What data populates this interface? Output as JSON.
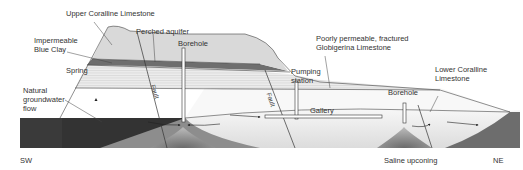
{
  "diagram": {
    "labels": {
      "upper_coralline": "Upper Coralline Limestone",
      "perched_aquifer": "Perched aquifer",
      "borehole_1": "Borehole",
      "blue_clay_line1": "Impermeable",
      "blue_clay_line2": "Blue Clay",
      "spring": "Spring",
      "globigerina_line1": "Poorly permeable, fractured",
      "globigerina_line2": "Globigerina Limestone",
      "pumping_line1": "Pumping",
      "pumping_line2": "station",
      "lower_coralline_line1": "Lower Coralline",
      "lower_coralline_line2": "Limestone",
      "natural_flow_line1": "Natural",
      "natural_flow_line2": "groundwater",
      "natural_flow_line3": "flow",
      "gallery": "Gallery",
      "borehole_2": "Borehole",
      "saline_upconing": "Saline upconing",
      "fault": "Fault",
      "sw": "SW",
      "ne": "NE"
    },
    "colors": {
      "upper_coralline": "#d9d9d9",
      "blue_clay": "#6e6e6e",
      "globigerina": "#e6e6e6",
      "lower_coralline": "#f2f2f2",
      "sea": "#3a3a3a",
      "saline": "#8a8a8a",
      "lines": "#333333"
    }
  }
}
